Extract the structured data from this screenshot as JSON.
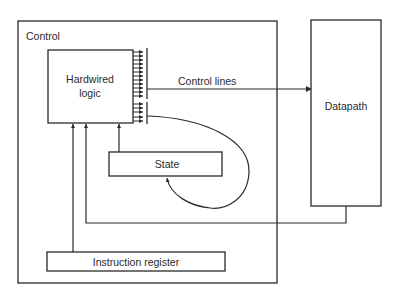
{
  "diagram": {
    "control_box": {
      "label": "Control"
    },
    "hardwired_logic": {
      "label_line1": "Hardwired",
      "label_line2": "logic"
    },
    "control_lines": {
      "label": "Control lines"
    },
    "datapath": {
      "label": "Datapath"
    },
    "state": {
      "label": "State"
    },
    "instruction_register": {
      "label": "Instruction register"
    },
    "output_arrow_count": 16
  },
  "colors": {
    "stroke": "#2a2a2a",
    "background": "#ffffff"
  }
}
